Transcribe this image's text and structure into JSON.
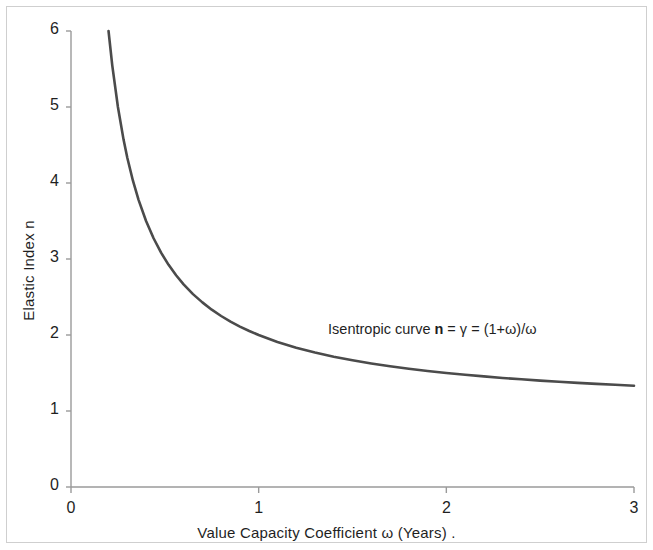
{
  "chart_data": {
    "type": "line",
    "title": "",
    "xlabel": "Value Capacity Coefficient ω (Years)  .",
    "ylabel": "Elastic Index n",
    "xlim": [
      0,
      3
    ],
    "ylim": [
      0,
      6
    ],
    "xticks": [
      "0",
      "1",
      "2",
      "3"
    ],
    "xtick_values": [
      0,
      1,
      2,
      3
    ],
    "yticks": [
      "0",
      "1",
      "2",
      "3",
      "4",
      "5",
      "6"
    ],
    "ytick_values": [
      0,
      1,
      2,
      3,
      4,
      5,
      6
    ],
    "grid": false,
    "legend": "none",
    "annotations": [
      {
        "text_prefix": "Isentropic curve ",
        "text_symbol": "n",
        "text_suffix": " = γ = (1+ω)/ω",
        "x": 1.37,
        "y": 2.05
      }
    ],
    "series": [
      {
        "name": "Isentropic curve n = (1+ω)/ω",
        "color": "#4b4b4b",
        "linewidth": 2.6,
        "x": [
          0.2,
          0.22,
          0.25,
          0.28,
          0.3,
          0.33,
          0.36,
          0.4,
          0.44,
          0.48,
          0.52,
          0.56,
          0.6,
          0.65,
          0.7,
          0.75,
          0.8,
          0.85,
          0.9,
          0.95,
          1.0,
          1.1,
          1.2,
          1.3,
          1.4,
          1.5,
          1.6,
          1.7,
          1.8,
          1.9,
          2.0,
          2.1,
          2.2,
          2.3,
          2.4,
          2.5,
          2.6,
          2.7,
          2.8,
          2.9,
          3.0
        ],
        "y": [
          6.0,
          5.545,
          5.0,
          4.571,
          4.333,
          4.03,
          3.778,
          3.5,
          3.273,
          3.083,
          2.923,
          2.786,
          2.667,
          2.538,
          2.429,
          2.333,
          2.25,
          2.176,
          2.111,
          2.053,
          2.0,
          1.909,
          1.833,
          1.769,
          1.714,
          1.667,
          1.625,
          1.588,
          1.556,
          1.526,
          1.5,
          1.476,
          1.455,
          1.435,
          1.417,
          1.4,
          1.385,
          1.37,
          1.357,
          1.345,
          1.333
        ]
      }
    ],
    "equation": "n = γ = (1+ω)/ω",
    "axis_color": "#9a9a9a"
  },
  "axes": {
    "x_title": "Value Capacity Coefficient ω (Years)  .",
    "y_title": "Elastic Index n"
  },
  "ticks": {
    "x": [
      "0",
      "1",
      "2",
      "3"
    ],
    "y": [
      "0",
      "1",
      "2",
      "3",
      "4",
      "5",
      "6"
    ]
  },
  "annotation": {
    "prefix": "Isentropic curve ",
    "symbol": "n",
    "suffix": " = γ = (1+ω)/ω"
  },
  "colors": {
    "curve": "#4b4b4b",
    "axis": "#9a9a9a",
    "text": "#1f1f1f",
    "frame": "#cfcfcf",
    "background": "#ffffff"
  }
}
